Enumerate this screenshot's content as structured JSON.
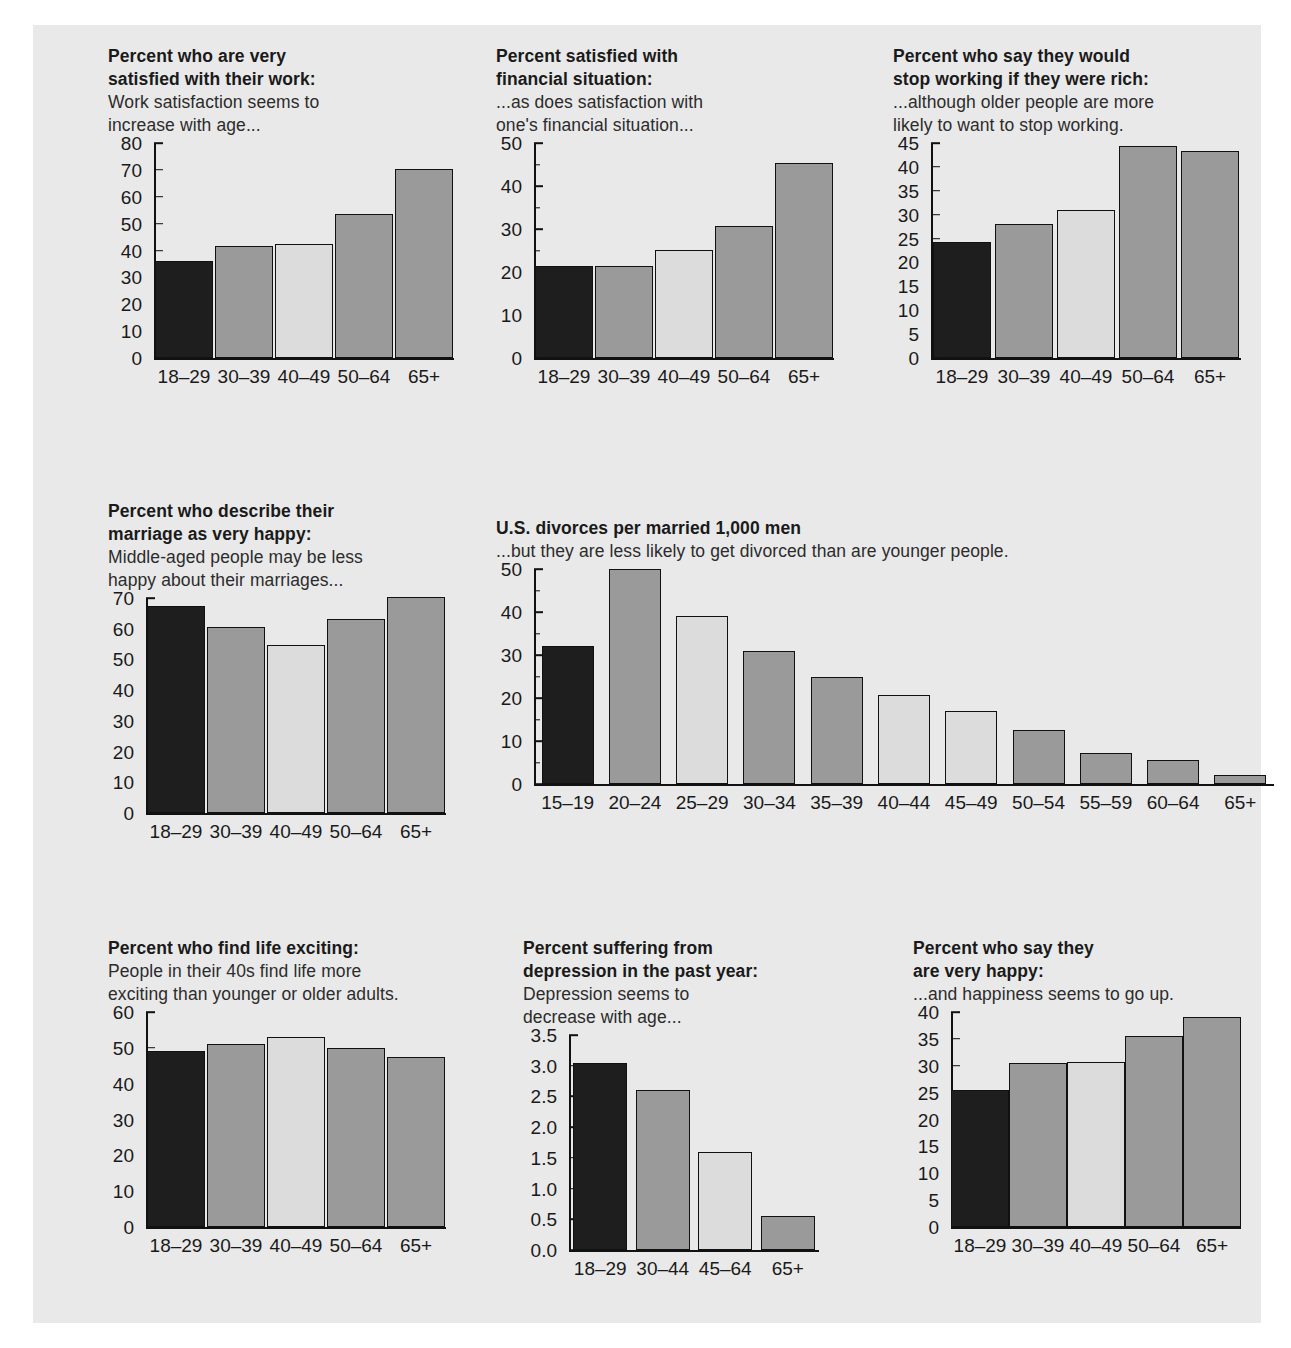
{
  "page": {
    "background": "#ffffff",
    "panel_background": "#e9e9e9"
  },
  "palette": {
    "dark": "#1e1e1e",
    "medium": "#9a9a9a",
    "light": "#dcdcdc",
    "outline": "#111111",
    "text": "#1a1a1a"
  },
  "chart_data": [
    {
      "id": "work-satisfaction",
      "type": "bar",
      "title": "Percent who are very\nsatisfied with their work:",
      "subtitle": "Work satisfaction seems to\nincrease with age...",
      "xlabel": "",
      "ylabel": "",
      "categories": [
        "18–29",
        "30–39",
        "40–49",
        "50–64",
        "65+"
      ],
      "values": [
        36,
        41.8,
        42.6,
        53.6,
        70.5
      ],
      "bar_colors": [
        "#1e1e1e",
        "#9a9a9a",
        "#dcdcdc",
        "#9a9a9a",
        "#9a9a9a"
      ],
      "ylim": [
        0,
        80
      ],
      "yticks": [
        0,
        10,
        20,
        30,
        40,
        50,
        60,
        70,
        80
      ],
      "yminorticks": [],
      "ytick_labels": [
        "0",
        "10",
        "20",
        "30",
        "40",
        "50",
        "60",
        "70",
        "80"
      ],
      "grid": false,
      "legend": "none"
    },
    {
      "id": "financial-satisfaction",
      "type": "bar",
      "title": "Percent satisfied with\nfinancial situation:",
      "subtitle": "...as does satisfaction with\none's financial situation...",
      "xlabel": "",
      "ylabel": "",
      "categories": [
        "18–29",
        "30–39",
        "40–49",
        "50–64",
        "65+"
      ],
      "values": [
        21.5,
        21.4,
        25.1,
        30.7,
        45.3
      ],
      "bar_colors": [
        "#1e1e1e",
        "#9a9a9a",
        "#dcdcdc",
        "#9a9a9a",
        "#9a9a9a"
      ],
      "ylim": [
        0,
        50
      ],
      "yticks": [
        0,
        10,
        20,
        30,
        40,
        50
      ],
      "yminorticks": [
        5,
        15,
        25,
        35,
        45
      ],
      "ytick_labels": [
        "0",
        "10",
        "20",
        "30",
        "40",
        "50"
      ],
      "grid": false,
      "legend": "none"
    },
    {
      "id": "stop-working-if-rich",
      "type": "bar",
      "title": "Percent who say they would\nstop working if they were rich:",
      "subtitle": "...although older people are more\nlikely to want to stop working.",
      "xlabel": "",
      "ylabel": "",
      "categories": [
        "18–29",
        "30–39",
        "40–49",
        "50–64",
        "65+"
      ],
      "values": [
        24.2,
        28.0,
        31.0,
        44.3,
        43.3
      ],
      "bar_colors": [
        "#1e1e1e",
        "#9a9a9a",
        "#dcdcdc",
        "#9a9a9a",
        "#9a9a9a"
      ],
      "ylim": [
        0,
        45
      ],
      "yticks": [
        0,
        5,
        10,
        15,
        20,
        25,
        30,
        35,
        40,
        45
      ],
      "yminorticks": [],
      "ytick_labels": [
        "0",
        "5",
        "10",
        "15",
        "20",
        "25",
        "30",
        "35",
        "40",
        "45"
      ],
      "grid": false,
      "legend": "none"
    },
    {
      "id": "happy-marriage",
      "type": "bar",
      "title": "Percent who describe their\nmarriage as very happy:",
      "subtitle": "Middle-aged people may be less\nhappy about their marriages...",
      "xlabel": "",
      "ylabel": "",
      "categories": [
        "18–29",
        "30–39",
        "40–49",
        "50–64",
        "65+"
      ],
      "values": [
        67.5,
        60.5,
        54.8,
        63.3,
        70.2
      ],
      "bar_colors": [
        "#1e1e1e",
        "#9a9a9a",
        "#dcdcdc",
        "#9a9a9a",
        "#9a9a9a"
      ],
      "ylim": [
        0,
        70
      ],
      "yticks": [
        0,
        10,
        20,
        30,
        40,
        50,
        60,
        70
      ],
      "yminorticks": [],
      "ytick_labels": [
        "0",
        "10",
        "20",
        "30",
        "40",
        "50",
        "60",
        "70"
      ],
      "grid": false,
      "legend": "none"
    },
    {
      "id": "us-divorces",
      "type": "bar",
      "title": "U.S. divorces per married 1,000 men",
      "subtitle": "...but they are less likely to get divorced than are younger people.",
      "xlabel": "",
      "ylabel": "",
      "categories": [
        "15–19",
        "20–24",
        "25–29",
        "30–34",
        "35–39",
        "40–44",
        "45–49",
        "50–54",
        "55–59",
        "60–64",
        "65+"
      ],
      "values": [
        32,
        50,
        39,
        31,
        25,
        20.7,
        17,
        12.5,
        7.3,
        5.5,
        2.0
      ],
      "bar_colors": [
        "#1e1e1e",
        "#9a9a9a",
        "#dcdcdc",
        "#9a9a9a",
        "#9a9a9a",
        "#dcdcdc",
        "#dcdcdc",
        "#9a9a9a",
        "#9a9a9a",
        "#9a9a9a",
        "#9a9a9a"
      ],
      "ylim": [
        0,
        50
      ],
      "yticks": [
        0,
        10,
        20,
        30,
        40,
        50
      ],
      "yminorticks": [
        5,
        15,
        25,
        35,
        45
      ],
      "ytick_labels": [
        "0",
        "10",
        "20",
        "30",
        "40",
        "50"
      ],
      "grid": false,
      "legend": "none"
    },
    {
      "id": "life-exciting",
      "type": "bar",
      "title": "Percent who find life exciting:",
      "subtitle": "People in their 40s find life more\nexciting than younger or older adults.",
      "xlabel": "",
      "ylabel": "",
      "categories": [
        "18–29",
        "30–39",
        "40–49",
        "50–64",
        "65+"
      ],
      "values": [
        49,
        51,
        53,
        50,
        47.5
      ],
      "bar_colors": [
        "#1e1e1e",
        "#9a9a9a",
        "#dcdcdc",
        "#9a9a9a",
        "#9a9a9a"
      ],
      "ylim": [
        0,
        60
      ],
      "yticks": [
        0,
        10,
        20,
        30,
        40,
        50,
        60
      ],
      "yminorticks": [],
      "ytick_labels": [
        "0",
        "10",
        "20",
        "30",
        "40",
        "50",
        "60"
      ],
      "grid": false,
      "legend": "none"
    },
    {
      "id": "depression",
      "type": "bar",
      "title": "Percent suffering from\ndepression in the past year:",
      "subtitle": "Depression seems to\ndecrease with age...",
      "xlabel": "",
      "ylabel": "",
      "categories": [
        "18–29",
        "30–44",
        "45–64",
        "65+"
      ],
      "values": [
        3.05,
        2.6,
        1.6,
        0.55
      ],
      "bar_colors": [
        "#1e1e1e",
        "#9a9a9a",
        "#dcdcdc",
        "#9a9a9a"
      ],
      "ylim": [
        0,
        3.5
      ],
      "yticks": [
        0,
        0.5,
        1.0,
        1.5,
        2.0,
        2.5,
        3.0,
        3.5
      ],
      "yminorticks": [],
      "ytick_labels": [
        "0.0",
        "0.5",
        "1.0",
        "1.5",
        "2.0",
        "2.5",
        "3.0",
        "3.5"
      ],
      "grid": false,
      "legend": "none"
    },
    {
      "id": "very-happy",
      "type": "bar",
      "title": "Percent who say they\nare very happy:",
      "subtitle": "...and happiness seems to go up.",
      "xlabel": "",
      "ylabel": "",
      "categories": [
        "18–29",
        "30–39",
        "40–49",
        "50–64",
        "65+"
      ],
      "values": [
        25.5,
        30.5,
        30.7,
        35.5,
        39.1
      ],
      "bar_colors": [
        "#1e1e1e",
        "#9a9a9a",
        "#dcdcdc",
        "#9a9a9a",
        "#9a9a9a"
      ],
      "ylim": [
        0,
        40
      ],
      "yticks": [
        0,
        5,
        10,
        15,
        20,
        25,
        30,
        35,
        40
      ],
      "yminorticks": [],
      "ytick_labels": [
        "0",
        "5",
        "10",
        "15",
        "20",
        "25",
        "30",
        "35",
        "40"
      ],
      "grid": false,
      "legend": "none"
    }
  ],
  "layout": [
    {
      "id": "work-satisfaction",
      "left": 75,
      "top": 20,
      "title_w": 330,
      "plot_w": 300,
      "plot_h": 215,
      "bar_w": 58,
      "gap": 4,
      "ylab_w": 36,
      "xfont": 19
    },
    {
      "id": "financial-satisfaction",
      "left": 463,
      "top": 20,
      "title_w": 330,
      "plot_w": 300,
      "plot_h": 215,
      "bar_w": 58,
      "gap": 4,
      "ylab_w": 28,
      "xfont": 19
    },
    {
      "id": "stop-working-if-rich",
      "left": 860,
      "top": 20,
      "title_w": 360,
      "plot_w": 310,
      "plot_h": 215,
      "bar_w": 58,
      "gap": 4,
      "ylab_w": 28,
      "xfont": 19
    },
    {
      "id": "happy-marriage",
      "left": 75,
      "top": 475,
      "title_w": 340,
      "plot_w": 300,
      "plot_h": 215,
      "bar_w": 58,
      "gap": 4,
      "ylab_w": 28,
      "xfont": 19
    },
    {
      "id": "us-divorces",
      "left": 463,
      "top": 492,
      "title_w": 700,
      "plot_w": 740,
      "plot_h": 215,
      "bar_w": 52,
      "gap": 14,
      "ylab_w": 28,
      "xfont": 19
    },
    {
      "id": "life-exciting",
      "left": 75,
      "top": 912,
      "title_w": 380,
      "plot_w": 300,
      "plot_h": 215,
      "bar_w": 58,
      "gap": 4,
      "ylab_w": 28,
      "xfont": 19
    },
    {
      "id": "depression",
      "left": 490,
      "top": 912,
      "title_w": 330,
      "plot_w": 250,
      "plot_h": 215,
      "bar_w": 54,
      "gap": 4,
      "ylab_w": 36,
      "xfont": 19
    },
    {
      "id": "very-happy",
      "left": 880,
      "top": 912,
      "title_w": 340,
      "plot_w": 290,
      "plot_h": 215,
      "bar_w": 58,
      "gap": 4,
      "ylab_w": 28,
      "xfont": 19
    }
  ]
}
